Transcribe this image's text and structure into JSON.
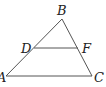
{
  "diagram": {
    "type": "geometry",
    "points": {
      "A": {
        "label": "A",
        "x": 6,
        "y": 76
      },
      "B": {
        "label": "B",
        "x": 62,
        "y": 19
      },
      "C": {
        "label": "C",
        "x": 92,
        "y": 76
      },
      "D": {
        "label": "D",
        "x": 34,
        "y": 48
      },
      "F": {
        "label": "F",
        "x": 78,
        "y": 48
      }
    },
    "segments": [
      "AB",
      "BC",
      "AC",
      "DF"
    ],
    "colors": {
      "line": "#555555",
      "text": "#222222",
      "background": "#ffffff"
    }
  }
}
